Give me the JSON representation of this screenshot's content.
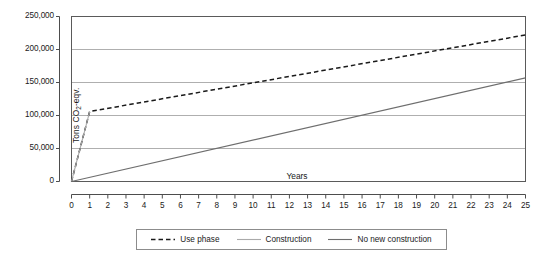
{
  "chart_data": {
    "type": "line",
    "title": "",
    "xlabel": "Years",
    "ylabel": "Tons CO2-eqv.",
    "ylabel_base": "Tons CO",
    "ylabel_sub": "2",
    "ylabel_tail": "-eqv.",
    "xlim": [
      0,
      25
    ],
    "ylim": [
      0,
      250000
    ],
    "grid": true,
    "grid_axis": "y",
    "legend_position": "bottom-center",
    "x_ticks": [
      0,
      1,
      2,
      3,
      4,
      5,
      6,
      7,
      8,
      9,
      10,
      11,
      12,
      13,
      14,
      15,
      16,
      17,
      18,
      19,
      20,
      21,
      22,
      23,
      24,
      25
    ],
    "x_tick_labels": [
      "0",
      "1",
      "2",
      "3",
      "4",
      "5",
      "6",
      "7",
      "8",
      "9",
      "10",
      "11",
      "12",
      "13",
      "14",
      "15",
      "16",
      "17",
      "18",
      "19",
      "20",
      "21",
      "22",
      "23",
      "24",
      "25"
    ],
    "y_ticks": [
      0,
      50000,
      100000,
      150000,
      200000,
      250000
    ],
    "y_tick_labels": [
      "0",
      "50,000",
      "100,000",
      "150,000",
      "200,000",
      "250,000"
    ],
    "series": [
      {
        "name": "Use phase",
        "style": "dashed",
        "color": "#1a1a1a",
        "x": [
          0,
          1,
          25
        ],
        "values": [
          0,
          106000,
          222000
        ]
      },
      {
        "name": "Construction",
        "style": "solid",
        "color": "#aaaaaa",
        "x": [
          0,
          1
        ],
        "values": [
          0,
          106000
        ]
      },
      {
        "name": "No new construction",
        "style": "solid",
        "color": "#6e6e6e",
        "x": [
          0,
          25
        ],
        "values": [
          0,
          157000
        ]
      }
    ]
  },
  "legend": {
    "entries": [
      {
        "label": "Use phase",
        "style": "dashed",
        "color": "#1a1a1a"
      },
      {
        "label": "Construction",
        "style": "solid",
        "color": "#aaaaaa"
      },
      {
        "label": "No new construction",
        "style": "solid",
        "color": "#6e6e6e"
      }
    ]
  },
  "colors": {
    "background": "#ffffff",
    "frame": "#5a5a5a",
    "gridline": "#9a9a9a",
    "axis_ruler": "#4d4d4d",
    "text": "#1a1a1a",
    "use_phase": "#1a1a1a",
    "construction": "#aaaaaa",
    "no_new_construction": "#6e6e6e"
  }
}
